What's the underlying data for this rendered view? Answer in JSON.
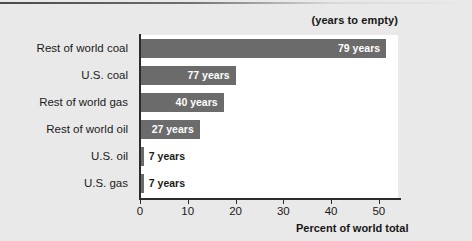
{
  "chart_data": {
    "type": "bar",
    "orientation": "horizontal",
    "title": "",
    "header_note": "(years to empty)",
    "xlabel": "Percent of world total",
    "ylabel": "",
    "xlim": [
      0,
      54
    ],
    "xticks": [
      0,
      10,
      20,
      30,
      40,
      50
    ],
    "xtick_labels": [
      "0",
      "10",
      "20",
      "30",
      "40",
      "50"
    ],
    "grid": false,
    "legend": null,
    "bar_color": "#6b6b6b",
    "plot_background": "#ffffff",
    "figure_background": "#e9e9e9",
    "categories": [
      "Rest of world coal",
      "U.S. coal",
      "Rest of world gas",
      "Rest of world oil",
      "U.S. oil",
      "U.S. gas"
    ],
    "values": [
      51.5,
      20.0,
      17.5,
      12.5,
      0.8,
      0.8
    ],
    "data_labels": [
      "79 years",
      "77 years",
      "40 years",
      "27 years",
      "7 years",
      "7 years"
    ],
    "data_label_placement": [
      "inside",
      "inside",
      "inside",
      "inside",
      "outside",
      "outside"
    ],
    "bars": [
      {
        "category": "Rest of world coal",
        "value": 51.5,
        "label": "79 years",
        "years_to_empty": 79,
        "label_inside": true
      },
      {
        "category": "U.S. coal",
        "value": 20.0,
        "label": "77 years",
        "years_to_empty": 77,
        "label_inside": true
      },
      {
        "category": "Rest of world gas",
        "value": 17.5,
        "label": "40 years",
        "years_to_empty": 40,
        "label_inside": true
      },
      {
        "category": "Rest of world oil",
        "value": 12.5,
        "label": "27 years",
        "years_to_empty": 27,
        "label_inside": true
      },
      {
        "category": "U.S. oil",
        "value": 0.8,
        "label": "7 years",
        "years_to_empty": 7,
        "label_inside": false
      },
      {
        "category": "U.S. gas",
        "value": 0.8,
        "label": "7 years",
        "years_to_empty": 7,
        "label_inside": false
      }
    ]
  }
}
